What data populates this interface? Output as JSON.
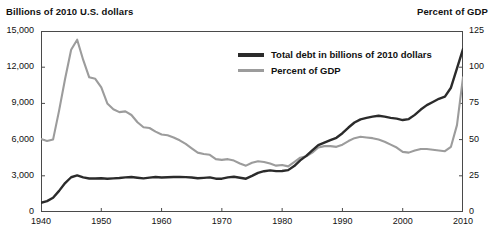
{
  "chart_data": {
    "type": "line",
    "title": "",
    "xlabel": "",
    "ylabel": "Billions of 2010 U.S. dollars",
    "y2label": "Percent of GDP",
    "grid": false,
    "legend_position": "upper-center-right",
    "xlim": [
      1940,
      2010
    ],
    "ylim": [
      0,
      15000
    ],
    "y2lim": [
      0,
      125
    ],
    "xticks": [
      "1940",
      "1950",
      "1960",
      "1970",
      "1980",
      "1990",
      "2000",
      "2010"
    ],
    "xtick_values": [
      1940,
      1950,
      1960,
      1970,
      1980,
      1990,
      2000,
      2010
    ],
    "yticks_left": [
      "0",
      "3,000",
      "6,000",
      "9,000",
      "12,000",
      "15,000"
    ],
    "ytick_left_values": [
      0,
      3000,
      6000,
      9000,
      12000,
      15000
    ],
    "yticks_right": [
      "0",
      "25",
      "50",
      "75",
      "100",
      "125"
    ],
    "ytick_right_values": [
      0,
      25,
      50,
      75,
      100,
      125
    ],
    "x": [
      1940,
      1941,
      1942,
      1943,
      1944,
      1945,
      1946,
      1947,
      1948,
      1949,
      1950,
      1951,
      1952,
      1953,
      1954,
      1955,
      1956,
      1957,
      1958,
      1959,
      1960,
      1961,
      1962,
      1963,
      1964,
      1965,
      1966,
      1967,
      1968,
      1969,
      1970,
      1971,
      1972,
      1973,
      1974,
      1975,
      1976,
      1977,
      1978,
      1979,
      1980,
      1981,
      1982,
      1983,
      1984,
      1985,
      1986,
      1987,
      1988,
      1989,
      1990,
      1991,
      1992,
      1993,
      1994,
      1995,
      1996,
      1997,
      1998,
      1999,
      2000,
      2001,
      2002,
      2003,
      2004,
      2005,
      2006,
      2007,
      2008,
      2009,
      2010
    ],
    "series": [
      {
        "name": "Total debt in billions of 2010 dollars",
        "axis": "left",
        "color": "#2b2b2b",
        "values": [
          760,
          900,
          1180,
          1750,
          2400,
          2880,
          3030,
          2870,
          2780,
          2780,
          2800,
          2760,
          2790,
          2820,
          2870,
          2900,
          2840,
          2790,
          2850,
          2900,
          2860,
          2880,
          2900,
          2900,
          2890,
          2860,
          2800,
          2830,
          2870,
          2760,
          2760,
          2870,
          2920,
          2840,
          2760,
          2990,
          3240,
          3380,
          3450,
          3390,
          3400,
          3470,
          3810,
          4280,
          4650,
          5110,
          5550,
          5750,
          5950,
          6150,
          6530,
          7000,
          7420,
          7680,
          7800,
          7900,
          7980,
          7900,
          7800,
          7740,
          7620,
          7700,
          8050,
          8490,
          8860,
          9120,
          9380,
          9560,
          10300,
          11900,
          13500
        ]
      },
      {
        "name": "Percent of GDP",
        "axis": "right",
        "color": "#9c9c9c",
        "values": [
          50.5,
          49.0,
          50.0,
          70.0,
          92.0,
          112.0,
          119.0,
          105.0,
          93.0,
          92.0,
          86.0,
          75.0,
          71.0,
          69.0,
          69.5,
          67.0,
          62.0,
          58.5,
          58.0,
          55.5,
          53.5,
          53.0,
          51.5,
          49.5,
          47.0,
          44.0,
          41.0,
          40.0,
          39.5,
          36.5,
          36.0,
          36.5,
          35.5,
          33.5,
          32.0,
          34.0,
          35.0,
          34.5,
          33.5,
          32.0,
          32.5,
          31.5,
          34.5,
          37.5,
          38.5,
          41.0,
          44.5,
          45.5,
          45.5,
          45.0,
          46.5,
          49.0,
          51.0,
          52.0,
          51.5,
          51.0,
          50.0,
          48.5,
          46.5,
          44.5,
          41.5,
          41.0,
          42.5,
          43.5,
          43.5,
          43.0,
          42.5,
          42.0,
          45.0,
          60.0,
          93.0
        ]
      }
    ]
  },
  "legend": {
    "items": [
      {
        "label": "Total debt in billions of 2010 dollars",
        "color": "#2b2b2b"
      },
      {
        "label": "Percent of GDP",
        "color": "#9c9c9c"
      }
    ]
  },
  "colors": {
    "debt_line": "#2b2b2b",
    "gdp_line": "#9c9c9c",
    "frame": "#4a4a4a",
    "background": "#ffffff",
    "text": "#111111"
  }
}
